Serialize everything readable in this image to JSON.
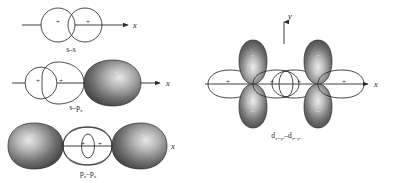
{
  "figure": {
    "background_color": "#ffffff",
    "line_color": "#2b2b2b",
    "positive_lobe_color": "#ffffff",
    "negative_lobe_color_dark": "#3a3a3a",
    "negative_lobe_color_light": "#bcbcbc"
  },
  "panels": [
    {
      "id": "s-s",
      "caption": "s–s",
      "axis_label_x": "x",
      "axis_label_y": "",
      "signs": [
        "+",
        "+"
      ],
      "description": "Two overlapping spherical s orbitals, both positive phase"
    },
    {
      "id": "s-px",
      "caption_main": "s–p",
      "caption_sub": "x",
      "axis_label_x": "x",
      "axis_label_y": "",
      "signs": [
        "+",
        "+",
        "−"
      ],
      "description": "Spherical s orbital overlapping the positive lobe of a p subscript x orbital"
    },
    {
      "id": "px-px",
      "caption_main": "p",
      "caption_sub_left": "x",
      "caption_dash": "–p",
      "caption_sub_right": "x",
      "axis_label_x": "x",
      "axis_label_y": "",
      "signs": [
        "−",
        "+",
        "+",
        "−"
      ],
      "description": "Two p subscript x orbitals overlapping end-on; inner positive lobes overlap"
    },
    {
      "id": "dx2y2-dx2y2",
      "caption_main": "d",
      "caption_sub": "x²−y²",
      "caption_dash": "–d",
      "axis_label_x": "x",
      "axis_label_y": "y",
      "signs": [
        "+",
        "−",
        "−",
        "+",
        "+",
        "−",
        "−",
        "+"
      ],
      "description": "Two d x squared minus y squared orbitals overlapping along the x axis"
    }
  ],
  "captions": {
    "panel_1": "s–s",
    "panel_2": "s–p",
    "panel_2_sub": "x",
    "panel_3_a": "p",
    "panel_3_a_sub": "x",
    "panel_3_b": "–p",
    "panel_3_b_sub": "x",
    "panel_4_a": "d",
    "panel_4_a_sub": "x²−y²",
    "panel_4_b": "–d",
    "panel_4_b_sub": "x²−y²"
  },
  "axis_labels": {
    "x_panel_1": "x",
    "x_panel_2": "x",
    "x_panel_3": "x",
    "x_panel_4": "x",
    "y_panel_4": "y"
  },
  "signs": {
    "plus": "+",
    "minus": "−"
  }
}
